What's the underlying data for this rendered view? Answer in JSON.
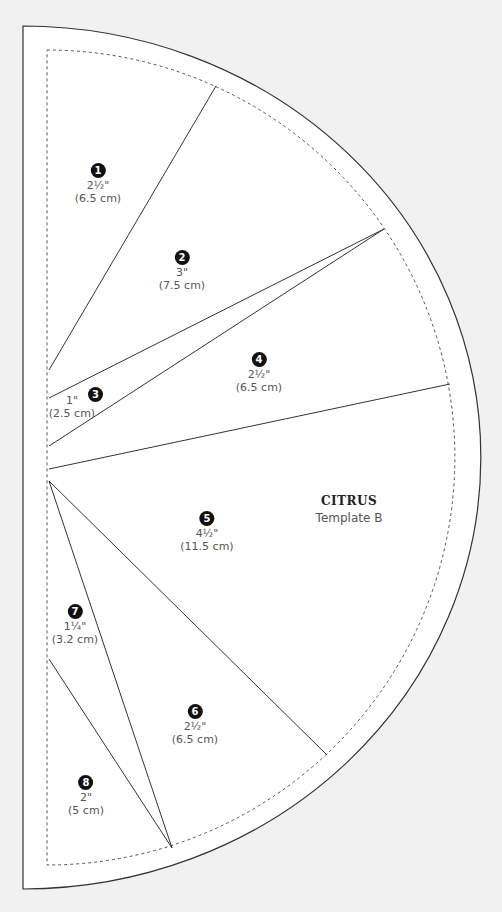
{
  "template": {
    "name": "CITRUS",
    "subtitle": "Template B"
  },
  "pieces": [
    {
      "number": "1",
      "inches": "2½\"",
      "cm": "(6.5 cm)"
    },
    {
      "number": "2",
      "inches": "3\"",
      "cm": "(7.5 cm)"
    },
    {
      "number": "3",
      "inches": "1\"",
      "cm": "(2.5 cm)"
    },
    {
      "number": "4",
      "inches": "2½\"",
      "cm": "(6.5 cm)"
    },
    {
      "number": "5",
      "inches": "4½\"",
      "cm": "(11.5 cm)"
    },
    {
      "number": "6",
      "inches": "2½\"",
      "cm": "(6.5 cm)"
    },
    {
      "number": "7",
      "inches": "1¼\"",
      "cm": "(3.2 cm)"
    },
    {
      "number": "8",
      "inches": "2\"",
      "cm": "(5 cm)"
    }
  ]
}
